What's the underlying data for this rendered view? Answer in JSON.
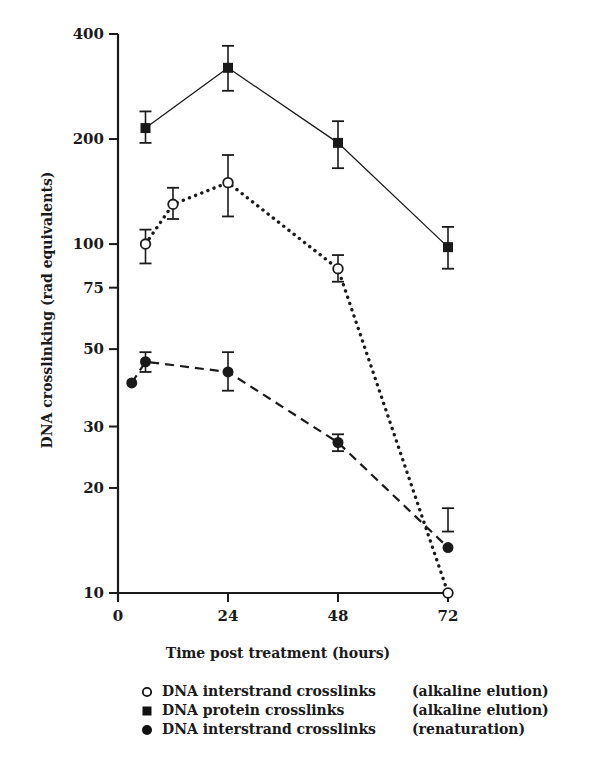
{
  "chart_data": {
    "type": "line",
    "title": "",
    "xlabel": "Time post treatment (hours)",
    "ylabel": "DNA crosslinking  (rad equivalents)",
    "yscale": "log",
    "xlim": [
      0,
      72
    ],
    "ylim": [
      10,
      400
    ],
    "xticks": [
      0,
      24,
      48,
      72
    ],
    "yticks": [
      10,
      20,
      30,
      50,
      75,
      100,
      200,
      400
    ],
    "grid": false,
    "legend_position": "below",
    "series": [
      {
        "name": "DNA interstrand crosslinks",
        "method": "(alkaline elution)",
        "marker": "open-circle",
        "line_style": "dotted",
        "x": [
          6,
          12,
          24,
          48,
          72
        ],
        "y": [
          100,
          130,
          150,
          85,
          10
        ],
        "err_low": [
          88,
          118,
          120,
          78,
          null
        ],
        "err_high": [
          110,
          145,
          180,
          93,
          null
        ]
      },
      {
        "name": "DNA protein crosslinks",
        "method": "(alkaline elution)",
        "marker": "filled-square",
        "line_style": "solid",
        "x": [
          6,
          24,
          48,
          72
        ],
        "y": [
          215,
          320,
          195,
          98
        ],
        "err_low": [
          195,
          275,
          165,
          85
        ],
        "err_high": [
          240,
          370,
          225,
          112
        ]
      },
      {
        "name": "DNA interstrand crosslinks",
        "method": "(renaturation)",
        "marker": "filled-circle",
        "line_style": "dashed",
        "x": [
          3,
          6,
          24,
          48,
          72
        ],
        "y": [
          40,
          46,
          43,
          27,
          13.5
        ],
        "err_low": [
          null,
          43,
          38,
          25.5,
          15
        ],
        "err_high": [
          null,
          49,
          49,
          28.5,
          17.5
        ]
      }
    ]
  },
  "legend": {
    "items": [
      {
        "marker": "open-circle",
        "label": "DNA interstrand crosslinks",
        "method": "(alkaline elution)"
      },
      {
        "marker": "filled-square",
        "label": "DNA protein crosslinks",
        "method": "(alkaline elution)"
      },
      {
        "marker": "filled-circle",
        "label": "DNA interstrand crosslinks",
        "method": "(renaturation)"
      }
    ]
  },
  "axes": {
    "x_tick_labels": [
      "0",
      "24",
      "48",
      "72"
    ],
    "y_tick_labels": [
      "400",
      "200",
      "100",
      "75",
      "50",
      "30",
      "20",
      "10"
    ]
  }
}
